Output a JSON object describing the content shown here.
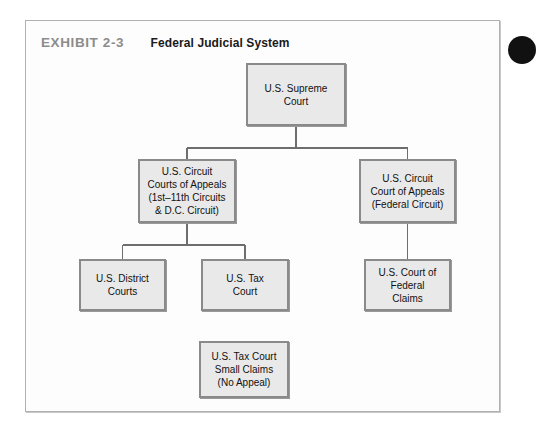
{
  "page": {
    "top_cut_text": "······································",
    "background_color": "#ffffff"
  },
  "exhibit": {
    "number": "EXHIBIT 2-3",
    "title": "Federal Judicial System",
    "number_color": "#8c8c8c",
    "title_color": "#1a1a1a",
    "panel_background": "#fdfdfd",
    "panel_border_color": "#b0b0b0"
  },
  "diagram": {
    "type": "hierarchy-tree",
    "node_fill": "#e9e9e9",
    "node_border": "#8a8a8a",
    "connector_color": "#6e6e6e",
    "nodes": [
      {
        "id": "supreme-court",
        "label": "U.S. Supreme\nCourt",
        "level": 0
      },
      {
        "id": "circuit-courts-of-appeals",
        "label": "U.S. Circuit\nCourts of Appeals\n(1st–11th Circuits\n& D.C. Circuit)",
        "level": 1
      },
      {
        "id": "circuit-court-of-appeals-federal",
        "label": "U.S. Circuit\nCourt of Appeals\n(Federal Circuit)",
        "level": 1
      },
      {
        "id": "district-courts",
        "label": "U.S. District\nCourts",
        "level": 2
      },
      {
        "id": "tax-court",
        "label": "U.S. Tax\nCourt",
        "level": 2
      },
      {
        "id": "court-of-federal-claims",
        "label": "U.S. Court of\nFederal\nClaims",
        "level": 2
      },
      {
        "id": "tax-court-small-claims",
        "label": "U.S. Tax Court\nSmall Claims\n(No Appeal)",
        "level": 3
      }
    ],
    "edges": [
      {
        "from": "supreme-court",
        "to": "circuit-courts-of-appeals"
      },
      {
        "from": "supreme-court",
        "to": "circuit-court-of-appeals-federal"
      },
      {
        "from": "circuit-courts-of-appeals",
        "to": "district-courts"
      },
      {
        "from": "circuit-courts-of-appeals",
        "to": "tax-court"
      },
      {
        "from": "circuit-court-of-appeals-federal",
        "to": "court-of-federal-claims"
      }
    ],
    "unconnected_nodes": [
      "tax-court-small-claims"
    ]
  },
  "decoration": {
    "corner_circle_color": "#111111"
  }
}
